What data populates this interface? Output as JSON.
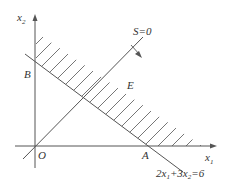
{
  "diagram": {
    "type": "linear-programming-feasible-region",
    "axes": {
      "x_label": "x",
      "x_sub": "1",
      "y_label": "x",
      "y_sub": "2",
      "origin_label": "O"
    },
    "points": {
      "A": "A",
      "B": "B",
      "E": "E"
    },
    "lines": {
      "constraint": {
        "label_parts": [
          "2x",
          "1",
          "+3x",
          "2",
          "=6"
        ]
      },
      "objective": {
        "label": "S=0"
      }
    },
    "colors": {
      "line": "#555555",
      "hatch": "#666666",
      "text": "#333333"
    }
  }
}
